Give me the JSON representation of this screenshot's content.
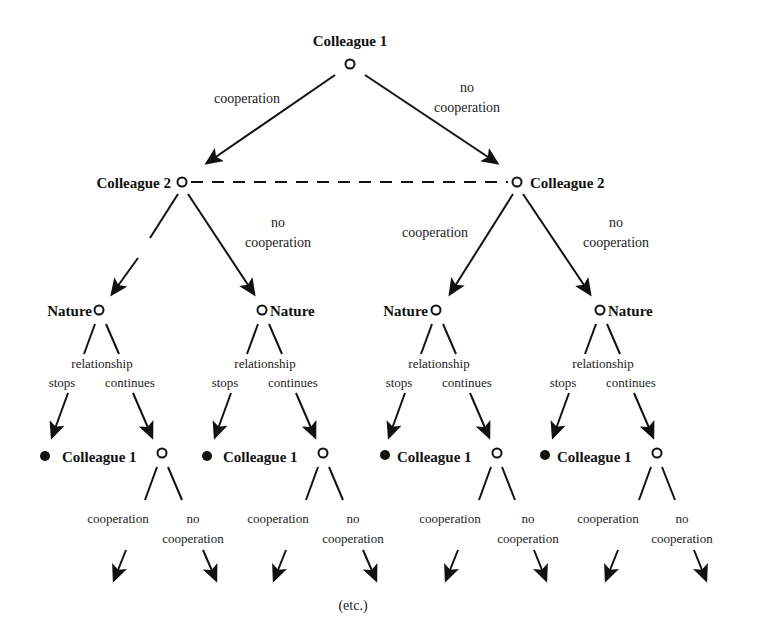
{
  "diagram": {
    "type": "game-tree",
    "root": {
      "label": "Colleague 1"
    },
    "root_edges": {
      "left": "cooperation",
      "right_line1": "no",
      "right_line2": "cooperation"
    },
    "level2": [
      {
        "label": "Colleague 2",
        "edge_left": "",
        "edge_right_line1": "no",
        "edge_right_line2": "cooperation"
      },
      {
        "label": "Colleague 2",
        "edge_left": "cooperation",
        "edge_right_line1": "no",
        "edge_right_line2": "cooperation"
      }
    ],
    "information_set": "dashed line connecting both Colleague 2 nodes",
    "nature_nodes": [
      {
        "label": "Nature",
        "branch_header": "relationship",
        "left": "stops",
        "right": "continues"
      },
      {
        "label": "Nature",
        "branch_header": "relationship",
        "left": "stops",
        "right": "continues"
      },
      {
        "label": "Nature",
        "branch_header": "relationship",
        "left": "stops",
        "right": "continues"
      },
      {
        "label": "Nature",
        "branch_header": "relationship",
        "left": "stops",
        "right": "continues"
      }
    ],
    "level4": [
      {
        "label": "Colleague 1",
        "left": "cooperation",
        "right_line1": "no",
        "right_line2": "cooperation"
      },
      {
        "label": "Colleague 1",
        "left": "cooperation",
        "right_line1": "no",
        "right_line2": "cooperation"
      },
      {
        "label": "Colleague 1",
        "left": "cooperation",
        "right_line1": "no",
        "right_line2": "cooperation"
      },
      {
        "label": "Colleague 1",
        "left": "cooperation",
        "right_line1": "no",
        "right_line2": "cooperation"
      }
    ],
    "footer": "(etc.)"
  }
}
